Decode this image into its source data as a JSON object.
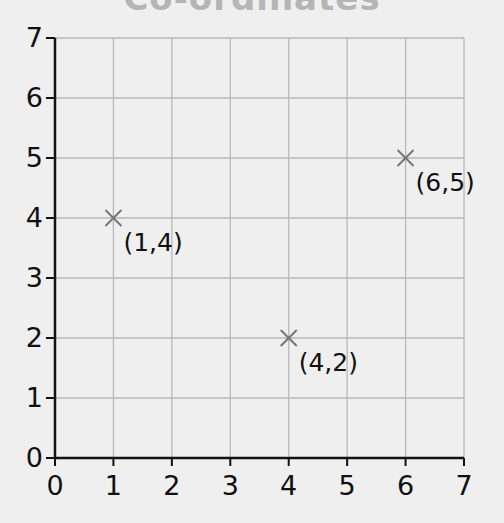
{
  "title": "Co-ordinates",
  "chart_data": {
    "type": "scatter",
    "title": "Co-ordinates",
    "xlabel": "",
    "ylabel": "",
    "xlim": [
      0,
      7
    ],
    "ylim": [
      0,
      7
    ],
    "grid": true,
    "x_ticks": [
      "0",
      "1",
      "2",
      "3",
      "4",
      "5",
      "6",
      "7"
    ],
    "y_ticks": [
      "0",
      "1",
      "2",
      "3",
      "4",
      "5",
      "6",
      "7"
    ],
    "marker": "x",
    "points": [
      {
        "x": 1,
        "y": 4,
        "label": "(1,4)"
      },
      {
        "x": 4,
        "y": 2,
        "label": "(4,2)"
      },
      {
        "x": 6,
        "y": 5,
        "label": "(6,5)"
      }
    ]
  },
  "colors": {
    "background": "#efefef",
    "grid": "#b8b8b8",
    "axis": "#111111",
    "marker": "#777777",
    "title": "#b5b5b5"
  }
}
